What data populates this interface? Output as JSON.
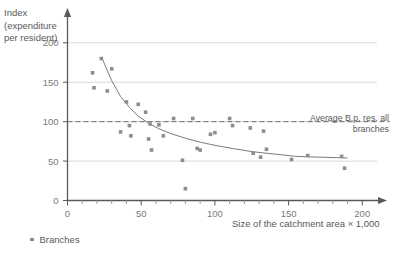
{
  "chart_data": {
    "type": "scatter",
    "title": "",
    "xlabel": "Size of the catchment area × 1,000",
    "ylabel": "Index (expenditure per resident)",
    "ylabel_lines": [
      "Index",
      "(expenditure",
      "per resident)"
    ],
    "xlim": [
      0,
      210
    ],
    "ylim": [
      0,
      215
    ],
    "xticks": [
      0,
      50,
      100,
      150,
      200
    ],
    "xticklabels": [
      "0",
      "50",
      "100",
      "150",
      "200"
    ],
    "xminor_step": 10,
    "yticks": [
      0,
      50,
      100,
      150,
      200
    ],
    "yticklabels": [
      "0",
      "50",
      "100",
      "150",
      "200"
    ],
    "grid": "horizontal",
    "gridlines": [
      50,
      100,
      150,
      200
    ],
    "legend": [
      {
        "label": "Branches",
        "marker": "square-dot",
        "color": "#8c8d8f"
      }
    ],
    "legend_position": "bottom-left",
    "annotations": [
      {
        "name": "average-reference-line",
        "text": "Average B.p. res. all branches",
        "text_lines": [
          "Average B.p. res. all",
          "branches"
        ],
        "y_value": 100,
        "style": "dashed",
        "color": "#58595b"
      }
    ],
    "series": [
      {
        "name": "Branches",
        "marker_color": "#8c8d8f",
        "points": [
          [
            17,
            162
          ],
          [
            18,
            143
          ],
          [
            23,
            180
          ],
          [
            27,
            139
          ],
          [
            30,
            167
          ],
          [
            36,
            87
          ],
          [
            40,
            125
          ],
          [
            42,
            95
          ],
          [
            43,
            82
          ],
          [
            48,
            122
          ],
          [
            53,
            112
          ],
          [
            55,
            78
          ],
          [
            56,
            97
          ],
          [
            57,
            64
          ],
          [
            62,
            96
          ],
          [
            65,
            82
          ],
          [
            72,
            104
          ],
          [
            78,
            51
          ],
          [
            80,
            15
          ],
          [
            85,
            104
          ],
          [
            88,
            66
          ],
          [
            90,
            64
          ],
          [
            97,
            84
          ],
          [
            100,
            86
          ],
          [
            110,
            104
          ],
          [
            112,
            95
          ],
          [
            124,
            92
          ],
          [
            126,
            60
          ],
          [
            131,
            55
          ],
          [
            133,
            88
          ],
          [
            135,
            65
          ],
          [
            152,
            52
          ],
          [
            163,
            57
          ],
          [
            186,
            56
          ],
          [
            188,
            41
          ]
        ]
      }
    ],
    "trendline": {
      "name": "fitted-decay-curve",
      "type": "exponential-decay",
      "color": "#7a7b7d",
      "x_start": 24,
      "x_end": 190,
      "y_start": 178,
      "y_asymptote": 52,
      "points": [
        [
          24,
          178
        ],
        [
          30,
          152
        ],
        [
          36,
          132
        ],
        [
          42,
          118
        ],
        [
          48,
          107
        ],
        [
          55,
          98
        ],
        [
          62,
          91
        ],
        [
          70,
          85
        ],
        [
          80,
          79
        ],
        [
          90,
          74
        ],
        [
          100,
          70
        ],
        [
          112,
          66
        ],
        [
          125,
          62
        ],
        [
          140,
          59
        ],
        [
          155,
          56
        ],
        [
          170,
          55
        ],
        [
          190,
          54
        ]
      ]
    }
  }
}
